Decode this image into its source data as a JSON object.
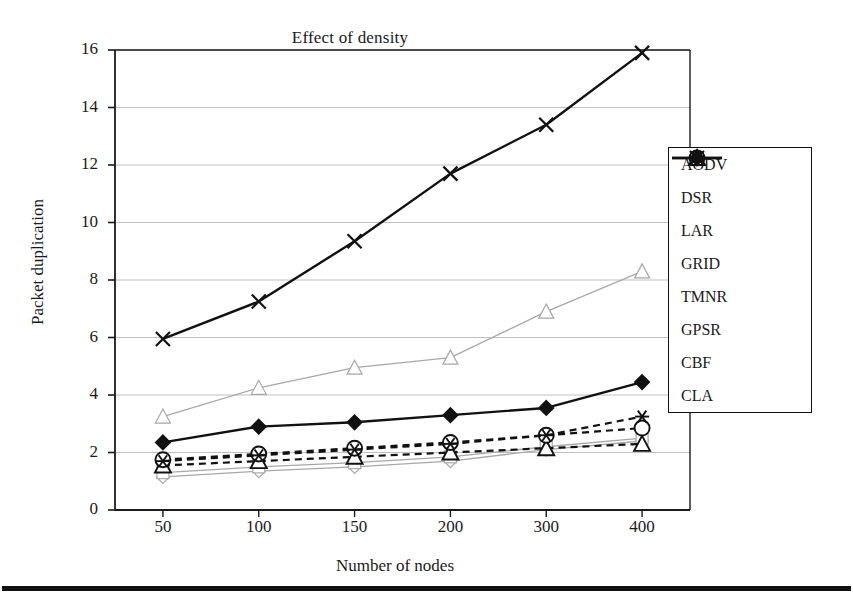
{
  "chart_data": {
    "type": "line",
    "title": "Effect of density",
    "xlabel": "Number of nodes",
    "ylabel": "Packet duplication",
    "categories": [
      "50",
      "100",
      "150",
      "200",
      "300",
      "400"
    ],
    "ylim": [
      0,
      16
    ],
    "yticks": [
      "0",
      "2",
      "4",
      "6",
      "8",
      "10",
      "12",
      "14",
      "16"
    ],
    "grid": true,
    "legend_position": "right-inside",
    "series": [
      {
        "name": "AODV",
        "marker": "diamond-open",
        "line": "solid-light",
        "values": [
          1.15,
          1.35,
          1.5,
          1.7,
          2.1,
          2.4
        ]
      },
      {
        "name": "DSR",
        "marker": "square-open",
        "line": "solid-light",
        "values": [
          1.3,
          1.5,
          1.65,
          1.85,
          2.2,
          2.5
        ]
      },
      {
        "name": "LAR",
        "marker": "triangle-open",
        "line": "solid-light",
        "values": [
          3.25,
          4.25,
          4.95,
          5.3,
          6.9,
          8.3
        ]
      },
      {
        "name": "GRID",
        "marker": "circle-open",
        "line": "dashed-bold",
        "values": [
          1.75,
          1.95,
          2.15,
          2.35,
          2.6,
          2.85
        ]
      },
      {
        "name": "TMNR",
        "marker": "asterisk",
        "line": "dashed-bold",
        "values": [
          1.7,
          1.9,
          2.1,
          2.3,
          2.6,
          3.25
        ]
      },
      {
        "name": "GPSR",
        "marker": "triangle-open",
        "line": "dashed-bold",
        "values": [
          1.55,
          1.7,
          1.85,
          2.0,
          2.15,
          2.3
        ]
      },
      {
        "name": "CBF",
        "marker": "x-cross",
        "line": "solid-bold",
        "values": [
          5.95,
          7.25,
          9.35,
          11.7,
          13.4,
          15.9
        ]
      },
      {
        "name": "CLA",
        "marker": "diamond-filled",
        "line": "solid-bold",
        "values": [
          2.35,
          2.9,
          3.05,
          3.3,
          3.55,
          4.45
        ]
      }
    ]
  },
  "legend": {
    "items": [
      {
        "label": "AODV"
      },
      {
        "label": "DSR"
      },
      {
        "label": "LAR"
      },
      {
        "label": "GRID"
      },
      {
        "label": "TMNR"
      },
      {
        "label": "GPSR"
      },
      {
        "label": "CBF"
      },
      {
        "label": "CLA"
      }
    ]
  },
  "colors": {
    "axis": "#1a1a1a",
    "grid": "#b9b9b9",
    "light_series": "#a8a8a8",
    "bold_series": "#111111",
    "background": "#ffffff"
  }
}
